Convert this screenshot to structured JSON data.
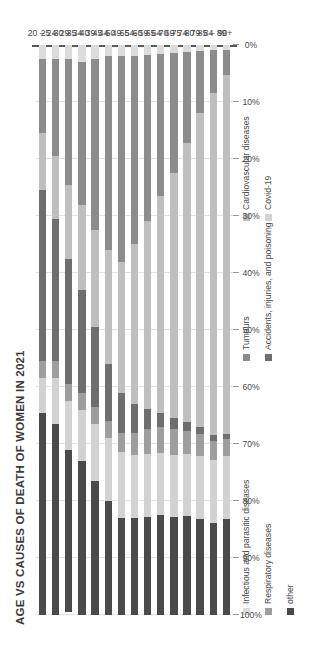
{
  "chart_data": {
    "type": "bar",
    "orientation": "stacked-100-percent",
    "title": "AGE VS CAUSES OF DEATH OF WOMEN IN 2021",
    "xlabel": "",
    "ylabel": "",
    "ylim": [
      0,
      100
    ],
    "grid": true,
    "legend_position": "bottom",
    "tick_labels": [
      "100%",
      "90%",
      "80%",
      "70%",
      "60%",
      "50%",
      "40%",
      "30%",
      "20%",
      "10%",
      "0%"
    ],
    "categories": [
      "20 – 24",
      "25 – 29",
      "30 – 34",
      "35 – 39",
      "40 – 44",
      "45 – 49",
      "50 – 54",
      "55 – 59",
      "60 – 64",
      "65 – 69",
      "70 – 74",
      "75 – 79",
      "80 – 84",
      "85 – 89",
      "90+"
    ],
    "series": [
      {
        "name": "Infectious and parasitic diseases",
        "color": "#dcdcdc",
        "values": [
          2.5,
          2.5,
          2.5,
          3.0,
          2.5,
          2.0,
          2.0,
          2.0,
          1.8,
          1.5,
          1.4,
          1.2,
          1.0,
          0.9,
          0.8
        ]
      },
      {
        "name": "Tumours",
        "color": "#8c8c8c",
        "values": [
          13.0,
          17.0,
          22.0,
          25.0,
          30.0,
          34.0,
          36.0,
          33.0,
          29.0,
          25.0,
          21.0,
          16.0,
          11.0,
          7.5,
          4.5
        ]
      },
      {
        "name": "Cardiovascular diseases",
        "color": "#bfbfbf",
        "values": [
          10.0,
          11.0,
          13.0,
          15.0,
          17.0,
          20.0,
          23.0,
          28.0,
          33.0,
          38.0,
          43.0,
          49.0,
          55.0,
          60.0,
          63.0
        ]
      },
      {
        "name": "Accidents, injuries, and poisoning",
        "color": "#6e6e6e",
        "values": [
          30.0,
          25.0,
          22.0,
          18.0,
          14.0,
          10.0,
          7.0,
          5.0,
          3.5,
          2.5,
          2.0,
          1.5,
          1.2,
          1.0,
          0.8
        ]
      },
      {
        "name": "Respiratory diseases",
        "color": "#9e9e9e",
        "values": [
          3.0,
          3.0,
          3.0,
          3.0,
          3.0,
          3.0,
          3.5,
          4.0,
          4.5,
          4.5,
          4.5,
          4.0,
          4.0,
          3.5,
          3.0
        ]
      },
      {
        "name": "Covid-19",
        "color": "#d2d2d2",
        "values": [
          6.0,
          8.0,
          8.5,
          9.0,
          10.0,
          11.0,
          11.5,
          11.0,
          11.0,
          11.0,
          11.0,
          11.0,
          11.0,
          11.0,
          11.0
        ]
      },
      {
        "name": "other",
        "color": "#4a4a4a",
        "values": [
          35.5,
          33.5,
          28.5,
          27.0,
          23.5,
          20.0,
          17.0,
          17.0,
          17.2,
          17.5,
          17.1,
          17.3,
          16.8,
          16.1,
          16.9
        ]
      }
    ]
  },
  "legend": {
    "items": [
      {
        "label": "Infectious and parasitic diseases",
        "color": "#dcdcdc"
      },
      {
        "label": "Tumours",
        "color": "#8c8c8c"
      },
      {
        "label": "Cardiovascular diseases",
        "color": "#bfbfbf"
      },
      {
        "label": "Respiratory diseases",
        "color": "#9e9e9e"
      },
      {
        "label": "Accidents, injuries, and poisoning",
        "color": "#6e6e6e"
      },
      {
        "label": "Covid-19",
        "color": "#d2d2d2"
      },
      {
        "label": "other",
        "color": "#4a4a4a"
      }
    ]
  }
}
